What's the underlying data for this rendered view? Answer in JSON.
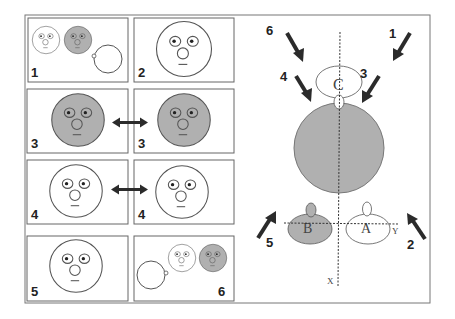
{
  "figure": {
    "colors": {
      "background": "#ffffff",
      "stroke": "#555555",
      "face_gray": "#b0b0b0",
      "arrow": "#2b2b2b",
      "label": "#222222"
    },
    "left_panels": [
      {
        "id": "p1",
        "label": "1",
        "content": "two small faces (white, gray) and a plain circle with small bump"
      },
      {
        "id": "p2",
        "label": "2",
        "content": "large white face"
      },
      {
        "id": "p3a",
        "label": "3",
        "content": "large gray face"
      },
      {
        "id": "p3b",
        "label": "3",
        "content": "large gray face"
      },
      {
        "id": "p4a",
        "label": "4",
        "content": "large white face"
      },
      {
        "id": "p4b",
        "label": "4",
        "content": "large white face"
      },
      {
        "id": "p5",
        "label": "5",
        "content": "large white face"
      },
      {
        "id": "p6",
        "label": "6",
        "content": "plain circle with bump, small white face, small gray face"
      }
    ],
    "right_diagram": {
      "object_labels": {
        "c": "C",
        "b": "B",
        "a": "A"
      },
      "axis_labels": {
        "x": "X",
        "y": "Y"
      },
      "arrow_labels": [
        "1",
        "2",
        "3",
        "4",
        "5",
        "6"
      ]
    }
  }
}
